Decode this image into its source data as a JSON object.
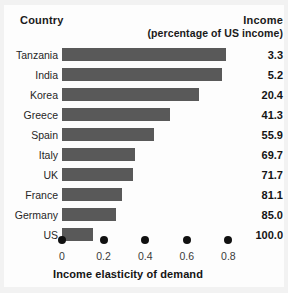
{
  "header": {
    "country_label": "Country",
    "income_label": "Income",
    "income_sublabel": "(percentage of US income)"
  },
  "axis": {
    "title": "Income elasticity of demand",
    "tick_labels": [
      "0",
      "0.2",
      "0.4",
      "0.6",
      "0.8"
    ],
    "tick_values": [
      0,
      0.2,
      0.4,
      0.6,
      0.8
    ]
  },
  "colors": {
    "bar": "#595959",
    "text": "#141414",
    "background": "#fdfdfd"
  },
  "chart_data": {
    "type": "bar",
    "orientation": "horizontal",
    "title": "",
    "xlabel": "Income elasticity of demand",
    "ylabel": "Country",
    "xlim": [
      0,
      0.9
    ],
    "grid": false,
    "legend": false,
    "categories": [
      "Tanzania",
      "India",
      "Korea",
      "Greece",
      "Spain",
      "Italy",
      "UK",
      "France",
      "Germany",
      "US"
    ],
    "values": [
      0.79,
      0.77,
      0.66,
      0.52,
      0.44,
      0.35,
      0.34,
      0.29,
      0.26,
      0.15
    ],
    "series": [
      {
        "name": "Income elasticity of demand",
        "values": [
          0.79,
          0.77,
          0.66,
          0.52,
          0.44,
          0.35,
          0.34,
          0.29,
          0.26,
          0.15
        ]
      }
    ],
    "annotations": {
      "column_header": "Income (percentage of US income)",
      "column_values": [
        "3.3",
        "5.2",
        "20.4",
        "41.3",
        "55.9",
        "69.7",
        "71.7",
        "81.1",
        "85.0",
        "100.0"
      ]
    },
    "rows": [
      {
        "country": "Tanzania",
        "elasticity": 0.79,
        "income": "3.3"
      },
      {
        "country": "India",
        "elasticity": 0.77,
        "income": "5.2"
      },
      {
        "country": "Korea",
        "elasticity": 0.66,
        "income": "20.4"
      },
      {
        "country": "Greece",
        "elasticity": 0.52,
        "income": "41.3"
      },
      {
        "country": "Spain",
        "elasticity": 0.44,
        "income": "55.9"
      },
      {
        "country": "Italy",
        "elasticity": 0.35,
        "income": "69.7"
      },
      {
        "country": "UK",
        "elasticity": 0.34,
        "income": "71.7"
      },
      {
        "country": "France",
        "elasticity": 0.29,
        "income": "81.1"
      },
      {
        "country": "Germany",
        "elasticity": 0.26,
        "income": "85.0"
      },
      {
        "country": "US",
        "elasticity": 0.15,
        "income": "100.0"
      }
    ]
  }
}
